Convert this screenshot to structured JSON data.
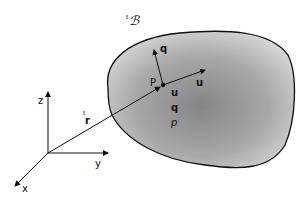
{
  "diagram": {
    "type": "continuum body with position vector",
    "body_label": "ᵗℬ",
    "body_label_prefix": "t",
    "body_label_symbol": "ℬ",
    "point_label": "P",
    "position_vector_label_prefix": "t",
    "position_vector_label": "r",
    "axes": {
      "x": "x",
      "y": "y",
      "z": "z"
    },
    "vectors_at_point": {
      "flux": "q",
      "velocity": "u"
    },
    "fields_listed": [
      "u",
      "q",
      "p"
    ],
    "colors": {
      "body_fill_center": "#8a8a8a",
      "body_fill_edge": "#d0d0d0",
      "stroke": "#111111"
    }
  }
}
